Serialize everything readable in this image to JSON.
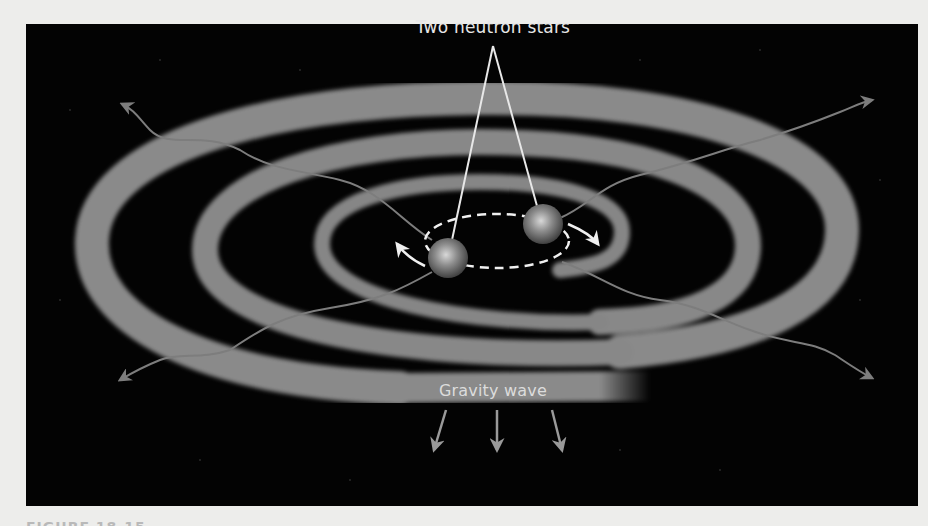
{
  "figure": {
    "labels": {
      "stars": "Two neutron stars",
      "wave": "Gravity wave"
    },
    "caption": "FIGURE 18-15",
    "elements": {
      "neutron_stars": 2,
      "orbit": "dashed ellipse with two rotation arrows",
      "spiral_bands": 3,
      "radiating_wavy_arrows": 4,
      "downward_arrows": 3
    },
    "colors": {
      "page_background": "#ededeb",
      "panel_background": "#030303",
      "spiral_band": "#8a8a8a",
      "star": "#8f8f8f",
      "label_text": "#e6e6e6",
      "arrow": "#7d7d7d",
      "orbit_dash": "#f2f2f2"
    }
  }
}
